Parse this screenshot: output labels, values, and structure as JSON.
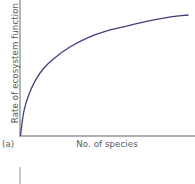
{
  "figure": {
    "panel_label": "(a)",
    "y_axis_label": "Rate of ecosystem function",
    "x_axis_label": "No. of species",
    "curve_color": "#3f3f7d",
    "axis_color": "#b4b4b8",
    "text_color": "#57575c",
    "background_color": "#ffffff"
  },
  "chart_data": {
    "type": "line",
    "title": "",
    "subtitle": "",
    "xlabel": "No. of species",
    "ylabel": "Rate of ecosystem function",
    "xlim": [
      0,
      1
    ],
    "ylim": [
      0,
      1
    ],
    "grid": false,
    "legend": "none",
    "axis_ticks": "none",
    "annotations": [
      "(a)"
    ],
    "series": [
      {
        "name": "Rate of ecosystem function vs. number of species",
        "shape": "saturating (decelerating) curve through the origin",
        "color": "#3f3f7d",
        "x": [
          0.0,
          0.02,
          0.05,
          0.09,
          0.14,
          0.2,
          0.29,
          0.4,
          0.52,
          0.64,
          0.76,
          0.88,
          1.0
        ],
        "y": [
          0.0,
          0.2,
          0.34,
          0.46,
          0.56,
          0.64,
          0.73,
          0.81,
          0.87,
          0.91,
          0.95,
          0.98,
          1.0
        ]
      }
    ]
  }
}
